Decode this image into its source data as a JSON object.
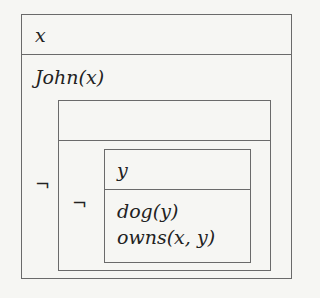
{
  "drs": {
    "outer": {
      "universe": "x",
      "conditions": [
        "John(x)"
      ]
    },
    "negation_outer": {
      "symbol": "¬",
      "universe": ""
    },
    "negation_inner": {
      "symbol": "¬"
    },
    "inner": {
      "universe": "y",
      "conditions": [
        "dog(y)",
        "owns(x, y)"
      ]
    }
  }
}
